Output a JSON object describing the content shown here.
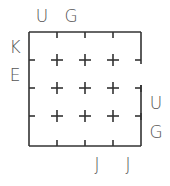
{
  "diagram": {
    "type": "grid-puzzle",
    "grid_size": 4,
    "top_labels": [
      "U",
      "G"
    ],
    "left_labels": [
      "K",
      "E"
    ],
    "right_labels": [
      "U",
      "G"
    ],
    "bottom_labels": [
      "J",
      "J"
    ],
    "stroke_color": "#333333",
    "label_color": "#555555"
  }
}
